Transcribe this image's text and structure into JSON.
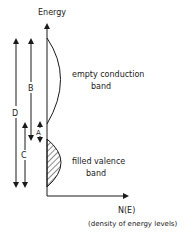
{
  "axis": {
    "y_label": "Energy",
    "x_label": "N(E)",
    "x_sublabel": "(density of energy levels)"
  },
  "bands": {
    "conduction_line1": "empty conduction",
    "conduction_line2": "band",
    "valence_line1": "filled valence",
    "valence_line2": "band"
  },
  "arrows": {
    "A": "A",
    "B": "B",
    "C": "C",
    "D": "D"
  },
  "colors": {
    "ink": "#1a1a1a",
    "background": "#ffffff"
  }
}
